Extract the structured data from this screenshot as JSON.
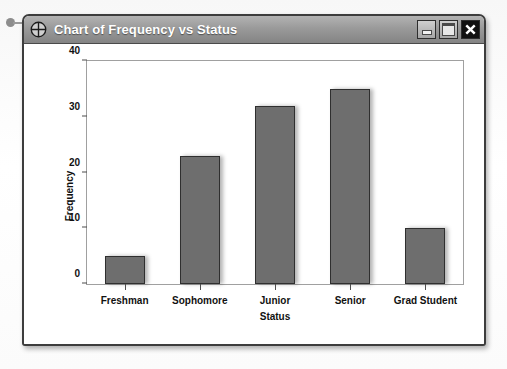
{
  "window": {
    "title": "Chart of Frequency vs Status",
    "icon": "crosshair-icon",
    "controls": {
      "minimize_label": "Minimize",
      "maximize_label": "Maximize",
      "close_label": "Close",
      "close_glyph": "✕"
    }
  },
  "chart_data": {
    "type": "bar",
    "title": "Chart of Frequency vs Status",
    "categories": [
      "Freshman",
      "Sophomore",
      "Junior",
      "Senior",
      "Grad Student"
    ],
    "values": [
      5,
      23,
      32,
      35,
      10
    ],
    "xlabel": "Status",
    "ylabel": "Frequency",
    "ylim": [
      0,
      40
    ],
    "yticks": [
      0,
      10,
      20,
      30,
      40
    ],
    "grid": false,
    "legend": false,
    "bar_color": "#6e6e6e",
    "bar_border_color": "#2f2f2f"
  }
}
